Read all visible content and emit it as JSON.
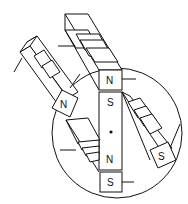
{
  "diagram": {
    "colors": {
      "line": "#111111",
      "background": "#ffffff"
    },
    "labels": {
      "top_magnet_pole": "N",
      "left_magnet_pole": "N",
      "center_bar_top": "S",
      "center_bar_bottom": "N",
      "bottom_magnet_pole": "S",
      "right_magnet_pole": "S"
    },
    "pivot": "center-dot"
  }
}
